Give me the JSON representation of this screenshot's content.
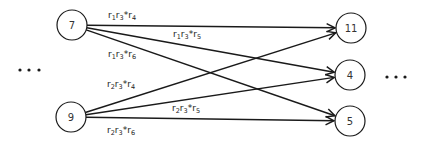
{
  "diagram": {
    "type": "bipartite-flow-graph",
    "nodes": [
      {
        "id": "7",
        "label": "7",
        "x": 72,
        "y": 25,
        "r": 15
      },
      {
        "id": "9",
        "label": "9",
        "x": 71,
        "y": 117,
        "r": 15
      },
      {
        "id": "11",
        "label": "11",
        "x": 351,
        "y": 28,
        "r": 15
      },
      {
        "id": "4",
        "label": "4",
        "x": 350,
        "y": 75,
        "r": 15
      },
      {
        "id": "5",
        "label": "5",
        "x": 350,
        "y": 121,
        "r": 15
      }
    ],
    "edges": [
      {
        "from": "7",
        "to": "11",
        "label": {
          "parts": [
            "r",
            "1",
            "r",
            "3",
            "*r",
            "4"
          ],
          "x": 108,
          "y": 18
        }
      },
      {
        "from": "7",
        "to": "4",
        "label": {
          "parts": [
            "r",
            "1",
            "r",
            "3",
            "*r",
            "5"
          ],
          "x": 173,
          "y": 37
        }
      },
      {
        "from": "7",
        "to": "5",
        "label": {
          "parts": [
            "r",
            "1",
            "r",
            "3",
            "*r",
            "6"
          ],
          "x": 108,
          "y": 57
        }
      },
      {
        "from": "9",
        "to": "11",
        "label": {
          "parts": [
            "r",
            "2",
            "r",
            "3",
            "*r",
            "4"
          ],
          "x": 107,
          "y": 87
        }
      },
      {
        "from": "9",
        "to": "4",
        "label": {
          "parts": [
            "r",
            "2",
            "r",
            "3",
            "*r",
            "5"
          ],
          "x": 172,
          "y": 111
        }
      },
      {
        "from": "9",
        "to": "5",
        "label": {
          "parts": [
            "r",
            "2",
            "r",
            "3",
            "*r",
            "6"
          ],
          "x": 107,
          "y": 133
        }
      }
    ],
    "ellipses": [
      {
        "name": "left-ellipsis",
        "dots": [
          [
            20,
            70
          ],
          [
            29,
            70
          ],
          [
            39,
            70
          ]
        ]
      },
      {
        "name": "right-ellipsis",
        "dots": [
          [
            387,
            77
          ],
          [
            396,
            77
          ],
          [
            405,
            77
          ]
        ]
      }
    ]
  }
}
